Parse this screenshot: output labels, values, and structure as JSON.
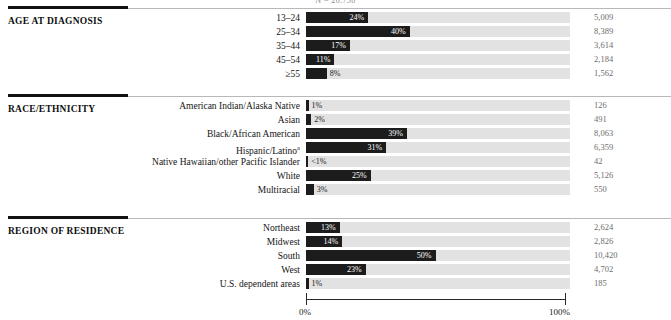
{
  "top_caption": "N = 20,758",
  "axis": {
    "left_label": "0%",
    "right_label": "100%",
    "min": 0,
    "max": 100
  },
  "sections": [
    {
      "title": "AGE AT DIAGNOSIS",
      "rows": [
        {
          "label": "13–24",
          "pct_label": "24%",
          "value": 24,
          "count": "5,009"
        },
        {
          "label": "25–34",
          "pct_label": "40%",
          "value": 40,
          "count": "8,389"
        },
        {
          "label": "35–44",
          "pct_label": "17%",
          "value": 17,
          "count": "3,614"
        },
        {
          "label": "45–54",
          "pct_label": "11%",
          "value": 11,
          "count": "2,184"
        },
        {
          "label": "≥55",
          "pct_label": "8%",
          "value": 8,
          "count": "1,562"
        }
      ]
    },
    {
      "title": "RACE/ETHNICITY",
      "rows": [
        {
          "label": "American Indian/Alaska Native",
          "pct_label": "1%",
          "value": 1,
          "count": "126"
        },
        {
          "label": "Asian",
          "pct_label": "2%",
          "value": 2,
          "count": "491"
        },
        {
          "label": "Black/African American",
          "pct_label": "39%",
          "value": 39,
          "count": "8,063"
        },
        {
          "label": "Hispanic/Latino",
          "label_sup": "a",
          "pct_label": "31%",
          "value": 31,
          "count": "6,359"
        },
        {
          "label": "Native Hawaiian/other Pacific Islander",
          "pct_label": "<1%",
          "value": 0.5,
          "count": "42"
        },
        {
          "label": "White",
          "pct_label": "25%",
          "value": 25,
          "count": "5,126"
        },
        {
          "label": "Multiracial",
          "pct_label": "3%",
          "value": 3,
          "count": "550"
        }
      ]
    },
    {
      "title": "REGION OF RESIDENCE",
      "rows": [
        {
          "label": "Northeast",
          "pct_label": "13%",
          "value": 13,
          "count": "2,624"
        },
        {
          "label": "Midwest",
          "pct_label": "14%",
          "value": 14,
          "count": "2,826"
        },
        {
          "label": "South",
          "pct_label": "50%",
          "value": 50,
          "count": "10,420"
        },
        {
          "label": "West",
          "pct_label": "23%",
          "value": 23,
          "count": "4,702"
        },
        {
          "label": "U.S. dependent areas",
          "pct_label": "1%",
          "value": 1,
          "count": "185"
        }
      ]
    }
  ],
  "chart_data": {
    "type": "bar",
    "orientation": "horizontal",
    "title": "",
    "xlabel": "",
    "ylabel": "",
    "xlim": [
      0,
      100
    ],
    "grid": false,
    "legend": "none",
    "value_unit": "percent",
    "groups": [
      {
        "name": "AGE AT DIAGNOSIS",
        "categories": [
          "13–24",
          "25–34",
          "35–44",
          "45–54",
          "≥55"
        ],
        "values": [
          24,
          40,
          17,
          11,
          8
        ],
        "value_labels": [
          "24%",
          "40%",
          "17%",
          "11%",
          "8%"
        ],
        "counts": [
          5009,
          8389,
          3614,
          2184,
          1562
        ],
        "count_labels": [
          "5,009",
          "8,389",
          "3,614",
          "2,184",
          "1,562"
        ]
      },
      {
        "name": "RACE/ETHNICITY",
        "categories": [
          "American Indian/Alaska Native",
          "Asian",
          "Black/African American",
          "Hispanic/Latino",
          "Native Hawaiian/other Pacific Islander",
          "White",
          "Multiracial"
        ],
        "values": [
          1,
          2,
          39,
          31,
          0.5,
          25,
          3
        ],
        "value_labels": [
          "1%",
          "2%",
          "39%",
          "31%",
          "<1%",
          "25%",
          "3%"
        ],
        "counts": [
          126,
          491,
          8063,
          6359,
          42,
          5126,
          550
        ],
        "count_labels": [
          "126",
          "491",
          "8,063",
          "6,359",
          "42",
          "5,126",
          "550"
        ]
      },
      {
        "name": "REGION OF RESIDENCE",
        "categories": [
          "Northeast",
          "Midwest",
          "South",
          "West",
          "U.S. dependent areas"
        ],
        "values": [
          13,
          14,
          50,
          23,
          1
        ],
        "value_labels": [
          "13%",
          "14%",
          "50%",
          "23%",
          "1%"
        ],
        "counts": [
          2624,
          2826,
          10420,
          4702,
          185
        ],
        "count_labels": [
          "2,624",
          "2,826",
          "10,420",
          "4,702",
          "185"
        ]
      }
    ]
  },
  "colors": {
    "bar": "#1c1c1c",
    "track": "#e2e2e2",
    "rule": "#111111",
    "count_text": "#6d6d6d"
  }
}
